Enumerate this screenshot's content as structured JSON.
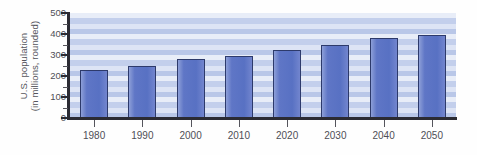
{
  "chart_data": {
    "type": "bar",
    "title": "",
    "xlabel": "",
    "ylabel": "U.S. population\n(in millions, rounded)",
    "ylabel_line1": "U.S. population",
    "ylabel_line2": "(in millions, rounded)",
    "categories": [
      "1980",
      "1990",
      "2000",
      "2010",
      "2020",
      "2030",
      "2040",
      "2050"
    ],
    "values": [
      227,
      249,
      281,
      294,
      325,
      347,
      381,
      394
    ],
    "ylim": [
      0,
      500
    ],
    "y_ticks": [
      "500",
      "400",
      "300",
      "200",
      "100",
      "0"
    ],
    "y_tick_values": [
      500,
      400,
      300,
      200,
      100,
      0
    ],
    "y_minor_tick_interval": 50,
    "grid": false,
    "background_stripes": true,
    "legend": "none",
    "bar_color": "#5871c3",
    "bar_border_color": "#2d3a6b",
    "axis_color": "#2b2b33",
    "stripe_color_light": "#e8edf8",
    "stripe_color_dark": "#b9c7e8"
  }
}
